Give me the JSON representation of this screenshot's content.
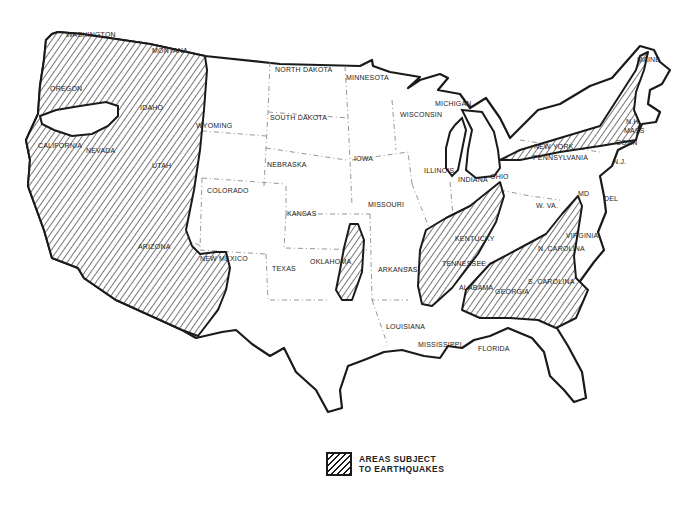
{
  "map": {
    "title": "Areas Subject to Earthquakes (Contiguous United States)",
    "hatch_color": "#1a1a1a",
    "background": "#ffffff",
    "state_labels": [
      {
        "name": "WASHINGTON",
        "x": 66,
        "y": 37
      },
      {
        "name": "MONTANA",
        "x": 152,
        "y": 53
      },
      {
        "name": "OREGON",
        "x": 50,
        "y": 91
      },
      {
        "name": "IDAHO",
        "x": 140,
        "y": 110
      },
      {
        "name": "WYOMING",
        "x": 196,
        "y": 128
      },
      {
        "name": "CALIFORNIA",
        "x": 38,
        "y": 148
      },
      {
        "name": "NEVADA",
        "x": 86,
        "y": 153
      },
      {
        "name": "UTAH",
        "x": 152,
        "y": 168
      },
      {
        "name": "COLORADO",
        "x": 207,
        "y": 193
      },
      {
        "name": "ARIZONA",
        "x": 138,
        "y": 249
      },
      {
        "name": "NEW MEXICO",
        "x": 200,
        "y": 261
      },
      {
        "name": "NORTH DAKOTA",
        "x": 275,
        "y": 72
      },
      {
        "name": "MINNESOTA",
        "x": 346,
        "y": 80
      },
      {
        "name": "SOUTH DAKOTA",
        "x": 270,
        "y": 120
      },
      {
        "name": "WISCONSIN",
        "x": 400,
        "y": 117
      },
      {
        "name": "MICHIGAN",
        "x": 435,
        "y": 106
      },
      {
        "name": "NEBRASKA",
        "x": 267,
        "y": 167
      },
      {
        "name": "IOWA",
        "x": 354,
        "y": 161
      },
      {
        "name": "ILLINOIS",
        "x": 424,
        "y": 173
      },
      {
        "name": "INDIANA",
        "x": 458,
        "y": 182
      },
      {
        "name": "OHIO",
        "x": 490,
        "y": 179
      },
      {
        "name": "KANSAS",
        "x": 287,
        "y": 216
      },
      {
        "name": "MISSOURI",
        "x": 368,
        "y": 207
      },
      {
        "name": "W. VA.",
        "x": 536,
        "y": 208
      },
      {
        "name": "MD",
        "x": 578,
        "y": 196
      },
      {
        "name": "DEL",
        "x": 604,
        "y": 201
      },
      {
        "name": "N.J.",
        "x": 613,
        "y": 164
      },
      {
        "name": "PENNSYLVANIA",
        "x": 533,
        "y": 160
      },
      {
        "name": "NEW YORK",
        "x": 534,
        "y": 149
      },
      {
        "name": "CONN",
        "x": 616,
        "y": 145
      },
      {
        "name": "MASS",
        "x": 624,
        "y": 133
      },
      {
        "name": "N.H.",
        "x": 626,
        "y": 124
      },
      {
        "name": "MAINE",
        "x": 637,
        "y": 62
      },
      {
        "name": "KENTUCKY",
        "x": 455,
        "y": 241
      },
      {
        "name": "VIRGINIA",
        "x": 566,
        "y": 238
      },
      {
        "name": "TEXAS",
        "x": 272,
        "y": 271
      },
      {
        "name": "OKLAHOMA",
        "x": 310,
        "y": 264
      },
      {
        "name": "ARKANSAS",
        "x": 378,
        "y": 272
      },
      {
        "name": "TENNESSEE",
        "x": 442,
        "y": 266
      },
      {
        "name": "N. CAROLINA",
        "x": 538,
        "y": 251
      },
      {
        "name": "ALABAMA",
        "x": 459,
        "y": 290
      },
      {
        "name": "GEORGIA",
        "x": 495,
        "y": 294
      },
      {
        "name": "S. CAROLINA",
        "x": 528,
        "y": 284
      },
      {
        "name": "LOUISIANA",
        "x": 386,
        "y": 329
      },
      {
        "name": "MISSISSIPPI",
        "x": 418,
        "y": 347
      },
      {
        "name": "FLORIDA",
        "x": 478,
        "y": 351
      }
    ]
  },
  "legend": {
    "icon": "hatched-square-swatch",
    "line1": "AREAS SUBJECT",
    "line2": "TO EARTHQUAKES"
  }
}
